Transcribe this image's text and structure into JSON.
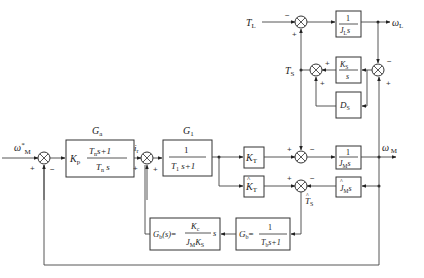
{
  "diagram": {
    "signals": {
      "omega_M_ref": "ω*M",
      "i_r": "ir",
      "T_L": "TL",
      "omega_L": "ωL",
      "T_S": "TS",
      "omega_M": "ωM",
      "T_S_hat": "T̂S"
    },
    "labels": {
      "Ga": "Ga",
      "G1": "G1"
    },
    "blocks": {
      "Ga": {
        "gain": "Kp",
        "num": "Tn s+1",
        "den": "Tn s"
      },
      "G1": {
        "num": "1",
        "den": "T1 s+1"
      },
      "KT": {
        "text": "KT"
      },
      "KT_hat": {
        "text": "K̂T"
      },
      "inv_JM": {
        "num": "1",
        "den": "JM s"
      },
      "JM_hat": {
        "text": "ĴM s"
      },
      "inv_JL": {
        "num": "1",
        "den": "JL s"
      },
      "KS": {
        "num": "KS",
        "den": "s"
      },
      "DS": {
        "text": "DS"
      },
      "Gb": {
        "lhs": "Gb=",
        "num": "1",
        "den": "Tb s+1"
      },
      "Gbs": {
        "lhs": "Gb(s)=",
        "num": "Kc",
        "den": "JM KS",
        "suffix": "s"
      }
    },
    "sums": {
      "s1": {
        "left": "+",
        "bottom": "−"
      },
      "s2": {
        "left": "+",
        "bottom": "+"
      },
      "s3": {
        "left": "+",
        "right": "−"
      },
      "s4": {
        "left": "+",
        "right": "−"
      },
      "sTL": {
        "left": "−",
        "bottom": "+"
      },
      "sTS": {
        "right": "+",
        "bottom": "+"
      },
      "sDiff": {
        "top": "−",
        "bottom": "+"
      }
    }
  }
}
